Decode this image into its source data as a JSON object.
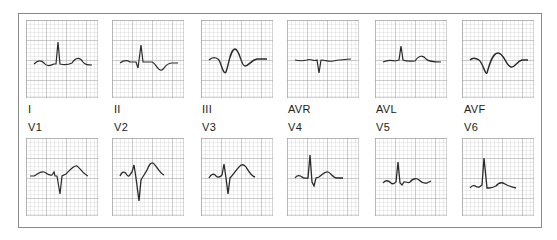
{
  "figure": {
    "grid_color": "#b8b8b8",
    "trace_color": "#2a2a2a",
    "limb_leads": [
      {
        "label": "I",
        "morphology": "upright P, tall narrow R, upright T"
      },
      {
        "label": "II",
        "morphology": "small P, biphasic QRS, inverted T"
      },
      {
        "label": "III",
        "morphology": "deep Q, broad R, inverted T"
      },
      {
        "label": "AVR",
        "morphology": "flat P, narrow negative QRS, flat T"
      },
      {
        "label": "AVL",
        "morphology": "small R, upright T"
      },
      {
        "label": "AVF",
        "morphology": "deep Q, broad R, inverted T"
      }
    ],
    "precordial_leads": [
      {
        "label": "V1",
        "morphology": "rS with deep S, upright T"
      },
      {
        "label": "V2",
        "morphology": "RS, tall upright T"
      },
      {
        "label": "V3",
        "morphology": "RS, upright T"
      },
      {
        "label": "V4",
        "morphology": "tall R, small S, upright T"
      },
      {
        "label": "V5",
        "morphology": "tall R, upright T"
      },
      {
        "label": "V6",
        "morphology": "tall R, upright T"
      }
    ]
  }
}
